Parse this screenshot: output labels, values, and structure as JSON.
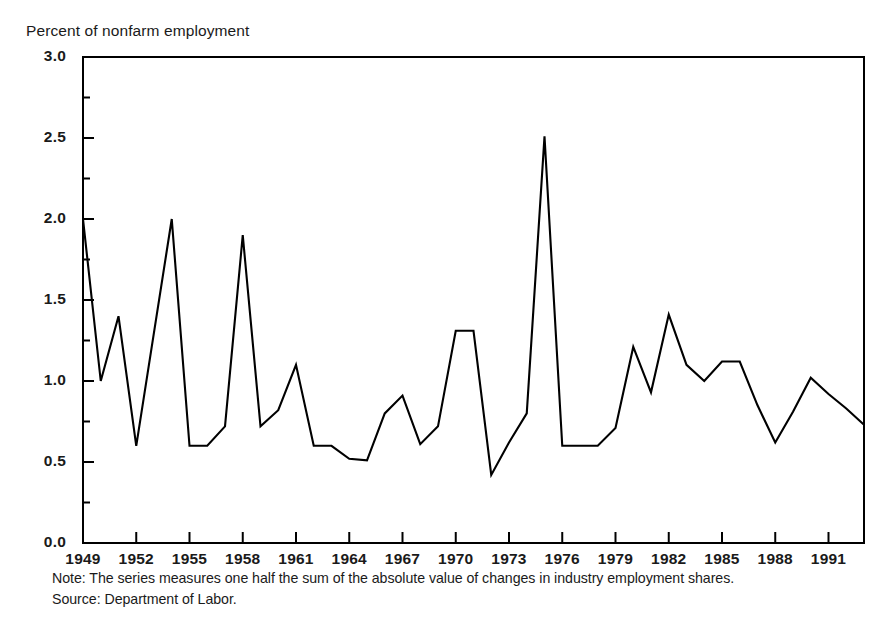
{
  "figure": {
    "axis_title": "Percent of nonfarm employment",
    "note": "Note: The series measures one half the sum of the absolute value of changes in  industry employment shares.",
    "source": "Source: Department of Labor."
  },
  "chart_data": {
    "type": "line",
    "title": "Percent of nonfarm employment",
    "xlabel": "",
    "ylabel": "Percent of nonfarm employment",
    "xlim": [
      1949,
      1993
    ],
    "ylim": [
      0.0,
      3.0
    ],
    "grid": false,
    "legend": "none",
    "line_color": "#000000",
    "y_ticks": [
      "0.0",
      "0.5",
      "1.0",
      "1.5",
      "2.0",
      "2.5",
      "3.0"
    ],
    "y_tick_values": [
      0.0,
      0.5,
      1.0,
      1.5,
      2.0,
      2.5,
      3.0
    ],
    "y_minor_tick_values": [
      0.25,
      0.75,
      1.25,
      1.75,
      2.25,
      2.75
    ],
    "x_ticks": [
      "1949",
      "1952",
      "1955",
      "1958",
      "1961",
      "1964",
      "1967",
      "1970",
      "1973",
      "1976",
      "1979",
      "1982",
      "1985",
      "1988",
      "1991"
    ],
    "x_tick_values": [
      1949,
      1952,
      1955,
      1958,
      1961,
      1964,
      1967,
      1970,
      1973,
      1976,
      1979,
      1982,
      1985,
      1988,
      1991
    ],
    "x": [
      1949,
      1950,
      1951,
      1952,
      1953,
      1954,
      1955,
      1956,
      1957,
      1958,
      1959,
      1960,
      1961,
      1962,
      1963,
      1964,
      1965,
      1966,
      1967,
      1968,
      1969,
      1970,
      1971,
      1972,
      1973,
      1974,
      1975,
      1976,
      1977,
      1978,
      1979,
      1980,
      1981,
      1982,
      1983,
      1984,
      1985,
      1986,
      1987,
      1988,
      1989,
      1990,
      1991,
      1992,
      1993
    ],
    "values": [
      2.0,
      1.0,
      1.4,
      0.6,
      1.3,
      2.0,
      0.6,
      0.6,
      0.72,
      1.9,
      0.72,
      0.82,
      1.1,
      0.6,
      0.6,
      0.52,
      0.51,
      0.8,
      0.91,
      0.61,
      0.72,
      1.31,
      1.31,
      0.42,
      0.62,
      0.8,
      2.51,
      0.6,
      0.6,
      0.6,
      0.71,
      1.21,
      0.93,
      1.41,
      1.1,
      1.0,
      1.12,
      1.12,
      0.85,
      0.62,
      0.81,
      1.02,
      0.92,
      0.83,
      0.73
    ],
    "annotations": [
      "Note: The series measures one half the sum of the absolute value of changes in  industry employment shares.",
      "Source: Department of Labor."
    ]
  },
  "y_labels": [
    {
      "text": "3.0",
      "value": 3.0
    },
    {
      "text": "2.5",
      "value": 2.5
    },
    {
      "text": "2.0",
      "value": 2.0
    },
    {
      "text": "1.5",
      "value": 1.5
    },
    {
      "text": "1.0",
      "value": 1.0
    },
    {
      "text": "0.5",
      "value": 0.5
    },
    {
      "text": "0.0",
      "value": 0.0
    }
  ],
  "x_labels": [
    {
      "text": "1949",
      "value": 1949
    },
    {
      "text": "1952",
      "value": 1952
    },
    {
      "text": "1955",
      "value": 1955
    },
    {
      "text": "1958",
      "value": 1958
    },
    {
      "text": "1961",
      "value": 1961
    },
    {
      "text": "1964",
      "value": 1964
    },
    {
      "text": "1967",
      "value": 1967
    },
    {
      "text": "1970",
      "value": 1970
    },
    {
      "text": "1973",
      "value": 1973
    },
    {
      "text": "1976",
      "value": 1976
    },
    {
      "text": "1979",
      "value": 1979
    },
    {
      "text": "1982",
      "value": 1982
    },
    {
      "text": "1985",
      "value": 1985
    },
    {
      "text": "1988",
      "value": 1988
    },
    {
      "text": "1991",
      "value": 1991
    }
  ]
}
